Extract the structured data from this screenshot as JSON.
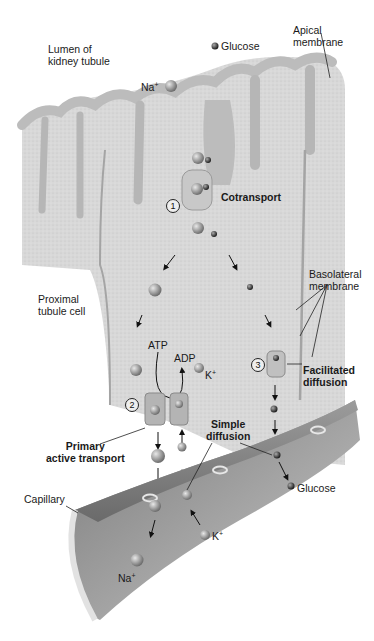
{
  "figure": {
    "background": "#ffffff",
    "colors": {
      "cell_fill": "#d6d6d6",
      "cell_texture": "#c4c4c4",
      "membrane": "#a8a8a8",
      "capillary_outer": "#8e8e8e",
      "capillary_inner": "#bdbdbd",
      "ion_na": "#9a9a9a",
      "ion_glucose": "#3c3c3c",
      "text": "#1a1a1a"
    }
  },
  "labels": {
    "lumen": [
      "Lumen of",
      "kidney tubule"
    ],
    "glucose_top": "Glucose",
    "apical": [
      "Apical",
      "membrane"
    ],
    "na_top": "Na",
    "na_top_sup": "+",
    "cotransport": "Cotransport",
    "step1": "1",
    "proximal": [
      "Proximal",
      "tubule cell"
    ],
    "basolateral": [
      "Basolateral",
      "membrane"
    ],
    "atp": "ATP",
    "adp": "ADP",
    "k_cell": "K",
    "k_cell_sup": "+",
    "step2": "2",
    "step3": "3",
    "facilitated": [
      "Facilitated",
      "diffusion"
    ],
    "primary": [
      "Primary",
      "active transport"
    ],
    "simple": [
      "Simple",
      "diffusion"
    ],
    "glucose_cap": "Glucose",
    "capillary": "Capillary",
    "k_cap": "K",
    "k_cap_sup": "+",
    "na_cap": "Na",
    "na_cap_sup": "+"
  }
}
